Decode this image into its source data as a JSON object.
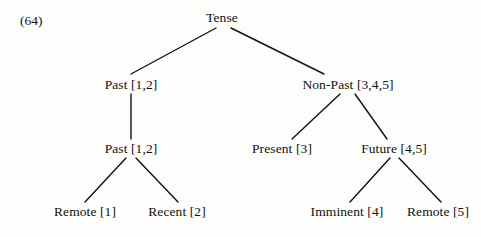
{
  "figure": {
    "example_number": "(64)",
    "type": "linguistic-tree-diagram",
    "ink_color": "#111111",
    "background_color": "#fdfdfc"
  },
  "tree": {
    "nodes": [
      {
        "id": "tense",
        "label": "Tense",
        "cx": 222,
        "cy": 18,
        "level": 0
      },
      {
        "id": "past1",
        "label": "Past [1,2]",
        "cx": 131,
        "cy": 85,
        "level": 1
      },
      {
        "id": "nonpast",
        "label": "Non-Past [3,4,5]",
        "cx": 348,
        "cy": 85,
        "level": 1
      },
      {
        "id": "past2",
        "label": "Past [1,2]",
        "cx": 131,
        "cy": 149,
        "level": 2
      },
      {
        "id": "present",
        "label": "Present [3]",
        "cx": 282,
        "cy": 149,
        "level": 2
      },
      {
        "id": "future",
        "label": "Future [4,5]",
        "cx": 394,
        "cy": 149,
        "level": 2
      },
      {
        "id": "remote-past",
        "label": "Remote [1]",
        "cx": 85,
        "cy": 212,
        "level": 3
      },
      {
        "id": "recent-past",
        "label": "Recent [2]",
        "cx": 177,
        "cy": 212,
        "level": 3
      },
      {
        "id": "imminent",
        "label": "Imminent [4]",
        "cx": 347,
        "cy": 212,
        "level": 3
      },
      {
        "id": "remote-fut",
        "label": "Remote [5]",
        "cx": 438,
        "cy": 212,
        "level": 3
      }
    ],
    "edges": [
      {
        "from": "tense",
        "to": "past1",
        "x1": 216,
        "y1": 28,
        "x2": 131,
        "y2": 74
      },
      {
        "from": "tense",
        "to": "nonpast",
        "x1": 231,
        "y1": 28,
        "x2": 324,
        "y2": 74
      },
      {
        "from": "past1",
        "to": "past2",
        "x1": 131,
        "y1": 94,
        "x2": 131,
        "y2": 139
      },
      {
        "from": "nonpast",
        "to": "present",
        "x1": 340,
        "y1": 94,
        "x2": 292,
        "y2": 139
      },
      {
        "from": "nonpast",
        "to": "future",
        "x1": 355,
        "y1": 94,
        "x2": 387,
        "y2": 139
      },
      {
        "from": "past2",
        "to": "remote-past",
        "x1": 126,
        "y1": 158,
        "x2": 85,
        "y2": 202
      },
      {
        "from": "past2",
        "to": "recent-past",
        "x1": 136,
        "y1": 158,
        "x2": 178,
        "y2": 202
      },
      {
        "from": "future",
        "to": "imminent",
        "x1": 390,
        "y1": 158,
        "x2": 350,
        "y2": 202
      },
      {
        "from": "future",
        "to": "remote-fut",
        "x1": 399,
        "y1": 158,
        "x2": 441,
        "y2": 202
      }
    ]
  },
  "chart_data": {
    "type": "tree",
    "title": "(64)",
    "root": {
      "label": "Tense",
      "features": [
        1,
        2,
        3,
        4,
        5
      ],
      "children": [
        {
          "label": "Past [1,2]",
          "features": [
            1,
            2
          ],
          "children": [
            {
              "label": "Past [1,2]",
              "features": [
                1,
                2
              ],
              "children": [
                {
                  "label": "Remote [1]",
                  "features": [
                    1
                  ],
                  "children": []
                },
                {
                  "label": "Recent [2]",
                  "features": [
                    2
                  ],
                  "children": []
                }
              ]
            }
          ]
        },
        {
          "label": "Non-Past [3,4,5]",
          "features": [
            3,
            4,
            5
          ],
          "children": [
            {
              "label": "Present [3]",
              "features": [
                3
              ],
              "children": []
            },
            {
              "label": "Future [4,5]",
              "features": [
                4,
                5
              ],
              "children": [
                {
                  "label": "Imminent [4]",
                  "features": [
                    4
                  ],
                  "children": []
                },
                {
                  "label": "Remote [5]",
                  "features": [
                    5
                  ],
                  "children": []
                }
              ]
            }
          ]
        }
      ]
    }
  }
}
